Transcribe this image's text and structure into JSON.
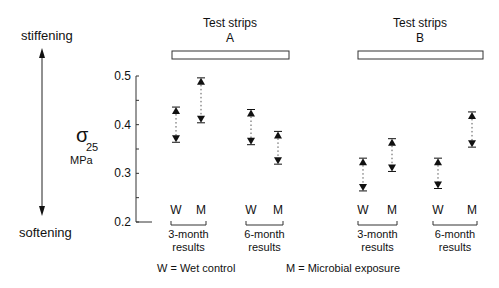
{
  "chart_data": {
    "type": "scatter",
    "title": "",
    "ylabel_symbol": "σ",
    "ylabel_subscript": "25",
    "ylabel_unit": "MPa",
    "ylim": [
      0.2,
      0.5
    ],
    "yticks": [
      0.2,
      0.3,
      0.4,
      0.5
    ],
    "ytick_labels": [
      "0.2",
      "0.3",
      "0.4",
      "0.5"
    ],
    "direction_labels": {
      "up": "stiffening",
      "down": "softening"
    },
    "groups": [
      {
        "name": "Test strips A",
        "title_line1": "Test strips",
        "title_line2": "A",
        "periods": [
          {
            "label_line1": "3-month",
            "label_line2": "results",
            "points": [
              {
                "category": "W",
                "high": 0.43,
                "low": 0.37
              },
              {
                "category": "M",
                "high": 0.49,
                "low": 0.41
              }
            ]
          },
          {
            "label_line1": "6-month",
            "label_line2": "results",
            "points": [
              {
                "category": "W",
                "high": 0.425,
                "low": 0.365
              },
              {
                "category": "M",
                "high": 0.38,
                "low": 0.325
              }
            ]
          }
        ]
      },
      {
        "name": "Test strips B",
        "title_line1": "Test strips",
        "title_line2": "B",
        "periods": [
          {
            "label_line1": "3-month",
            "label_line2": "results",
            "points": [
              {
                "category": "W",
                "high": 0.325,
                "low": 0.27
              },
              {
                "category": "M",
                "high": 0.365,
                "low": 0.31
              }
            ]
          },
          {
            "label_line1": "6-month",
            "label_line2": "results",
            "points": [
              {
                "category": "W",
                "high": 0.325,
                "low": 0.275
              },
              {
                "category": "M",
                "high": 0.42,
                "low": 0.36
              }
            ]
          }
        ]
      }
    ],
    "legend": [
      {
        "key": "W",
        "text": "W = Wet control"
      },
      {
        "key": "M",
        "text": "M = Microbial exposure"
      }
    ],
    "grid": false
  }
}
